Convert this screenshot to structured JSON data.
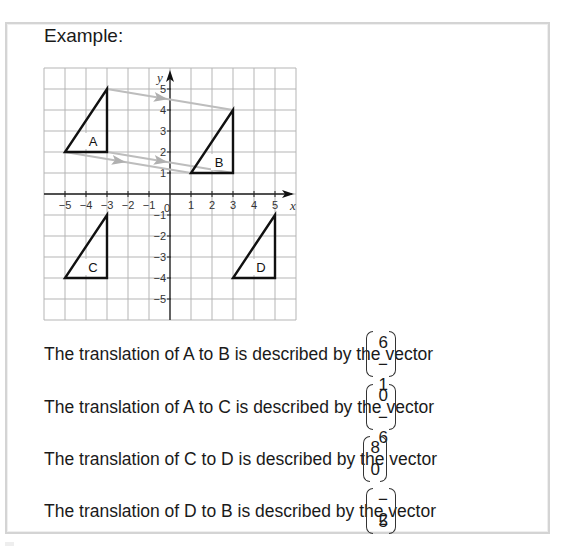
{
  "heading": "Example:",
  "chart_data": {
    "type": "diagram-coordinate-grid",
    "xlabel": "x",
    "ylabel": "y",
    "xlim": [
      -6,
      6
    ],
    "ylim": [
      -6,
      6
    ],
    "x_ticks": [
      "-5",
      "-4",
      "-3",
      "-2",
      "-1",
      "0",
      "1",
      "2",
      "3",
      "4",
      "5"
    ],
    "y_ticks": [
      "5",
      "4",
      "3",
      "2",
      "1",
      "-1",
      "-2",
      "-3",
      "-4",
      "-5"
    ],
    "grid": true,
    "shapes": [
      {
        "label": "A",
        "vertices": [
          [
            -5,
            2
          ],
          [
            -3,
            2
          ],
          [
            -3,
            5
          ]
        ]
      },
      {
        "label": "B",
        "vertices": [
          [
            1,
            1
          ],
          [
            3,
            1
          ],
          [
            3,
            4
          ]
        ]
      },
      {
        "label": "C",
        "vertices": [
          [
            -5,
            -4
          ],
          [
            -3,
            -4
          ],
          [
            -3,
            -1
          ]
        ]
      },
      {
        "label": "D",
        "vertices": [
          [
            3,
            -4
          ],
          [
            5,
            -4
          ],
          [
            5,
            -1
          ]
        ]
      }
    ],
    "arrows": [
      {
        "from": [
          -3,
          5
        ],
        "to": [
          3,
          4
        ]
      },
      {
        "from": [
          -5,
          2
        ],
        "to": [
          1,
          1
        ]
      },
      {
        "from": [
          -3,
          2
        ],
        "to": [
          3,
          1
        ]
      }
    ]
  },
  "statements": [
    {
      "text": "The translation of A to B is described by the vector",
      "top": "6",
      "bottom": "− 1"
    },
    {
      "text": "The translation of A to C is described by the vector",
      "top": "0",
      "bottom": "− 6"
    },
    {
      "text": "The translation of C to D is described by the vector",
      "top": "8",
      "bottom": "0"
    },
    {
      "text": "The translation of D to B is described by the vector",
      "top": "− 2",
      "bottom": "5"
    }
  ]
}
